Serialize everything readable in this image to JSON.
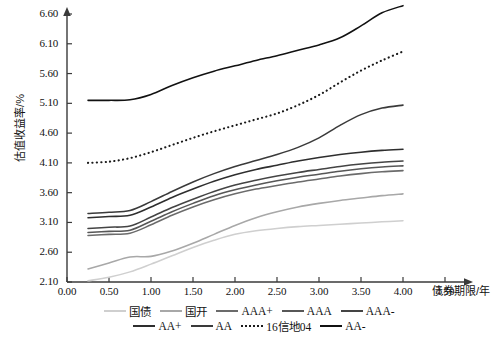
{
  "chart_data": {
    "type": "line",
    "title": "",
    "xlabel": "债券期限/年",
    "ylabel": "估值收益率/%",
    "xlim": [
      0.0,
      4.75
    ],
    "ylim": [
      2.1,
      6.6
    ],
    "xticks": [
      "0.00",
      "0.50",
      "1.00",
      "1.50",
      "2.00",
      "2.50",
      "3.00",
      "3.50",
      "4.00",
      "4.50"
    ],
    "xtick_values": [
      0.0,
      0.5,
      1.0,
      1.5,
      2.0,
      2.5,
      3.0,
      3.5,
      4.0,
      4.5
    ],
    "yticks": [
      "2.10",
      "2.60",
      "3.10",
      "3.60",
      "4.10",
      "4.60",
      "5.10",
      "5.60",
      "6.10",
      "6.60"
    ],
    "ytick_values": [
      2.1,
      2.6,
      3.1,
      3.6,
      4.1,
      4.6,
      5.1,
      5.6,
      6.1,
      6.6
    ],
    "grid": false,
    "legend_position": "below",
    "x": [
      0.25,
      0.5,
      0.75,
      1.0,
      1.25,
      1.5,
      1.75,
      2.0,
      2.25,
      2.5,
      2.75,
      3.0,
      3.25,
      3.5,
      3.75,
      4.0
    ],
    "series": [
      {
        "name": "国债",
        "color": "#cfcfcf",
        "style": "solid",
        "values": [
          2.12,
          2.18,
          2.27,
          2.4,
          2.54,
          2.68,
          2.8,
          2.9,
          2.96,
          3.0,
          3.03,
          3.05,
          3.07,
          3.09,
          3.11,
          3.13
        ]
      },
      {
        "name": "国开",
        "color": "#a8a8a8",
        "style": "solid",
        "values": [
          2.32,
          2.42,
          2.52,
          2.53,
          2.62,
          2.75,
          2.9,
          3.05,
          3.18,
          3.28,
          3.36,
          3.42,
          3.47,
          3.51,
          3.55,
          3.58
        ]
      },
      {
        "name": "AAA+",
        "color": "#6b6b6b",
        "style": "solid",
        "values": [
          2.88,
          2.9,
          2.92,
          3.06,
          3.22,
          3.36,
          3.48,
          3.58,
          3.66,
          3.72,
          3.78,
          3.83,
          3.88,
          3.92,
          3.95,
          3.97
        ]
      },
      {
        "name": "AAA",
        "color": "#575757",
        "style": "solid",
        "values": [
          2.93,
          2.95,
          2.97,
          3.12,
          3.28,
          3.42,
          3.55,
          3.65,
          3.73,
          3.8,
          3.86,
          3.91,
          3.96,
          4.0,
          4.03,
          4.05
        ]
      },
      {
        "name": "AAA-",
        "color": "#444444",
        "style": "solid",
        "values": [
          3.0,
          3.02,
          3.04,
          3.19,
          3.35,
          3.49,
          3.62,
          3.73,
          3.81,
          3.88,
          3.94,
          3.99,
          4.04,
          4.08,
          4.11,
          4.13
        ]
      },
      {
        "name": "AA+",
        "color": "#2e2e2e",
        "style": "solid",
        "values": [
          3.18,
          3.2,
          3.22,
          3.36,
          3.52,
          3.66,
          3.79,
          3.9,
          3.99,
          4.06,
          4.13,
          4.19,
          4.24,
          4.28,
          4.31,
          4.33
        ]
      },
      {
        "name": "AA",
        "color": "#3a3a3a",
        "style": "solid",
        "values": [
          3.25,
          3.27,
          3.3,
          3.45,
          3.62,
          3.78,
          3.92,
          4.04,
          4.14,
          4.24,
          4.36,
          4.52,
          4.73,
          4.91,
          5.02,
          5.07
        ]
      },
      {
        "name": "16信地04",
        "color": "#1a1a1a",
        "style": "dotted",
        "values": [
          4.1,
          4.12,
          4.18,
          4.28,
          4.4,
          4.52,
          4.63,
          4.73,
          4.83,
          4.93,
          5.07,
          5.24,
          5.45,
          5.65,
          5.82,
          5.97
        ]
      },
      {
        "name": "AA-",
        "color": "#111111",
        "style": "solid",
        "values": [
          5.15,
          5.15,
          5.16,
          5.25,
          5.4,
          5.53,
          5.64,
          5.73,
          5.82,
          5.9,
          5.99,
          6.08,
          6.2,
          6.4,
          6.62,
          6.74
        ]
      }
    ]
  },
  "legend": {
    "row1": [
      "国债",
      "国开",
      "AAA+",
      "AAA",
      "AAA-"
    ],
    "row2": [
      "AA+",
      "AA",
      "16信地04",
      "AA-"
    ]
  },
  "caption": ""
}
